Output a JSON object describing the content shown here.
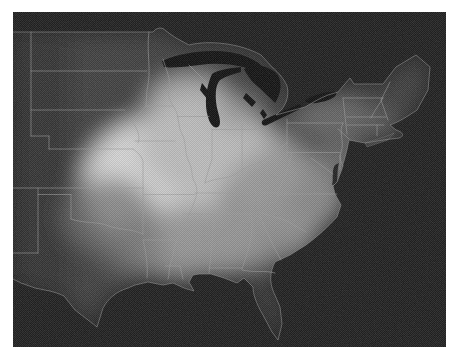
{
  "figure": {
    "regions": [
      "us-landmass",
      "great-lakes",
      "state-borders",
      "coastline",
      "gulf-of-mexico",
      "atlantic-ocean",
      "canada"
    ]
  },
  "colors": {
    "page_background": "#ffffff",
    "image_background": "#181818",
    "land_base": "#3a3a3a",
    "west_shade": "#242424",
    "bright_core": "#d9d9d9",
    "bright_mid": "#bdbdbd",
    "medium_gray": "#949494",
    "dim_gray": "#6f6f6f",
    "state_border": "#9c9c9c",
    "coastline": "#8f8f8f",
    "lake_fill": "#0a0a0a",
    "bay_fill": "#1c1c1c"
  }
}
